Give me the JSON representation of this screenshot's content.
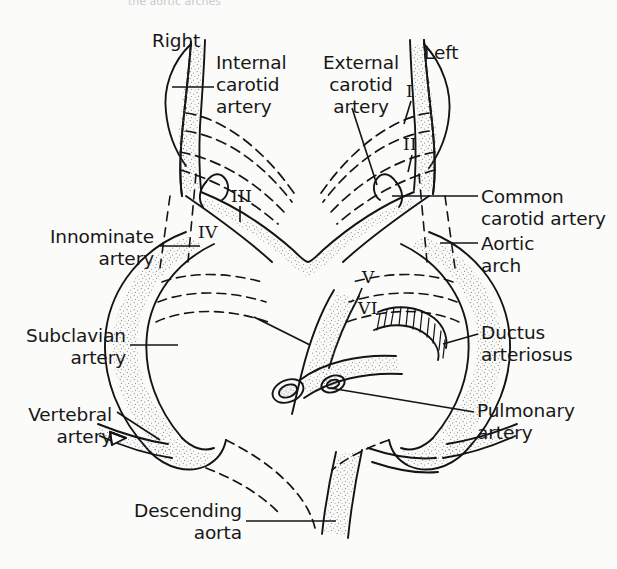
{
  "figure": {
    "cropped_header_text": "the aortic arches",
    "background_color": "#fbfbfa",
    "ink_color": "#141414"
  },
  "labels": {
    "right": "Right",
    "left": "Left",
    "internal_carotid_artery": "Internal\ncarotid\nartery",
    "external_carotid_artery": "External\ncarotid\nartery",
    "common_carotid_artery": "Common\ncarotid artery",
    "aortic_arch": "Aortic\narch",
    "ductus_arteriosus": "Ductus\narteriosus",
    "pulmonary_artery": "Pulmonary\nartery",
    "innominate_artery": "Innominate\nartery",
    "subclavian_artery": "Subclavian\nartery",
    "vertebral_artery": "Vertebral\nartery",
    "descending_aorta": "Descending\naorta"
  },
  "arch_numerals": [
    {
      "numeral": "I",
      "x": 406,
      "y": 92,
      "side": "left"
    },
    {
      "numeral": "II",
      "x": 406,
      "y": 145,
      "side": "left"
    },
    {
      "numeral": "III",
      "x": 236,
      "y": 196,
      "side": "right"
    },
    {
      "numeral": "IV",
      "x": 202,
      "y": 231,
      "side": "right"
    },
    {
      "numeral": "V",
      "x": 366,
      "y": 277,
      "side": "left"
    },
    {
      "numeral": "VI",
      "x": 362,
      "y": 308,
      "side": "left"
    }
  ],
  "legend_note": {
    "solid_lines": "persisting vessels",
    "dashed_lines": "regressed / obliterated arch segments"
  }
}
